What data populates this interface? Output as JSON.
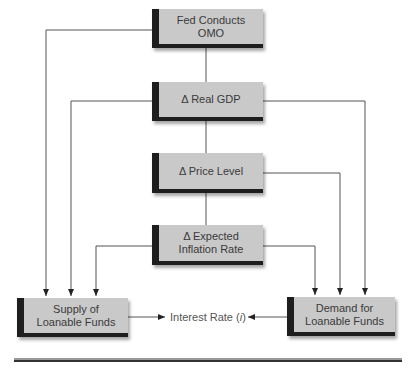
{
  "diagram": {
    "nodes": [
      {
        "id": "fed-omo",
        "label": "Fed Conducts OMO"
      },
      {
        "id": "real-gdp",
        "label": "Δ Real GDP"
      },
      {
        "id": "price-level",
        "label": "Δ Price Level"
      },
      {
        "id": "expected-inflation",
        "label_line1": "Δ Expected",
        "label_line2": "Inflation Rate"
      },
      {
        "id": "supply-lf",
        "label_line1": "Supply of",
        "label_line2": "Loanable Funds"
      },
      {
        "id": "demand-lf",
        "label_line1": "Demand for",
        "label_line2": "Loanable Funds"
      }
    ],
    "outcome": {
      "prefix": "Interest Rate (",
      "symbol": "i",
      "suffix": ")"
    },
    "edges": [
      {
        "from": "fed-omo",
        "to": "real-gdp"
      },
      {
        "from": "real-gdp",
        "to": "price-level"
      },
      {
        "from": "price-level",
        "to": "expected-inflation"
      },
      {
        "from": "fed-omo",
        "to": "supply-lf"
      },
      {
        "from": "real-gdp",
        "to": "supply-lf"
      },
      {
        "from": "expected-inflation",
        "to": "supply-lf"
      },
      {
        "from": "real-gdp",
        "to": "demand-lf"
      },
      {
        "from": "price-level",
        "to": "demand-lf"
      },
      {
        "from": "expected-inflation",
        "to": "demand-lf"
      },
      {
        "from": "supply-lf",
        "to": "interest-rate"
      },
      {
        "from": "demand-lf",
        "to": "interest-rate"
      }
    ],
    "colors": {
      "box_fill": "#c9c9c9",
      "box_accent": "#1e1e1e",
      "line": "#555555"
    }
  }
}
